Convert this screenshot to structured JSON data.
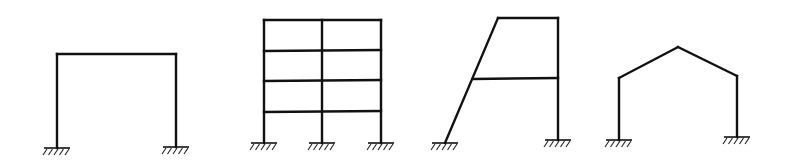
{
  "diagram": {
    "title": "",
    "background": "#ffffff",
    "line_color": "#111111",
    "frames": [
      {
        "id": "portal-frame",
        "label": "Single-bay portal frame",
        "members": [
          [
            57,
            148,
            57,
            54
          ],
          [
            57,
            54,
            176,
            54
          ],
          [
            176,
            54,
            176,
            147
          ]
        ],
        "supports": [
          {
            "type": "fixed",
            "x": 57,
            "y": 148
          },
          {
            "type": "fixed",
            "x": 176,
            "y": 147
          }
        ]
      },
      {
        "id": "multistory-frame",
        "label": "Two-bay four-storey frame",
        "members": [
          [
            264,
            143,
            264,
            20
          ],
          [
            322,
            143,
            322,
            20
          ],
          [
            381,
            143,
            381,
            20
          ],
          [
            264,
            20,
            381,
            20
          ],
          [
            264,
            51,
            381,
            50
          ],
          [
            264,
            81,
            381,
            80
          ],
          [
            264,
            112,
            381,
            111
          ]
        ],
        "supports": [
          {
            "type": "fixed",
            "x": 264,
            "y": 143
          },
          {
            "type": "fixed",
            "x": 322,
            "y": 143
          },
          {
            "type": "fixed",
            "x": 381,
            "y": 143
          }
        ]
      },
      {
        "id": "inclined-leg-frame",
        "label": "Frame with inclined column",
        "members": [
          [
            445,
            143,
            498,
            18
          ],
          [
            498,
            18,
            558,
            18
          ],
          [
            558,
            18,
            558,
            140
          ],
          [
            473,
            79,
            558,
            78
          ]
        ],
        "supports": [
          {
            "type": "fixed",
            "x": 445,
            "y": 143
          },
          {
            "type": "fixed",
            "x": 558,
            "y": 140
          }
        ]
      },
      {
        "id": "gable-frame",
        "label": "Gable (pitched-roof) frame",
        "members": [
          [
            619,
            140,
            619,
            78
          ],
          [
            619,
            78,
            678,
            47
          ],
          [
            678,
            47,
            737,
            76
          ],
          [
            737,
            76,
            737,
            137
          ]
        ],
        "supports": [
          {
            "type": "fixed",
            "x": 619,
            "y": 140
          },
          {
            "type": "fixed",
            "x": 737,
            "y": 137
          }
        ]
      }
    ]
  }
}
